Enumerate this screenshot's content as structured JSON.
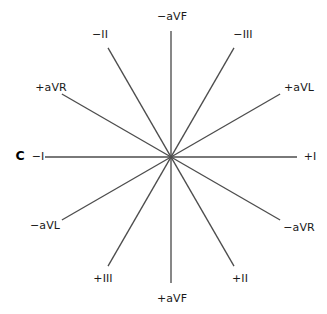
{
  "figure": {
    "panel_letter": "C",
    "panel_letter_position": {
      "x": 20,
      "y": 155
    },
    "canvas": {
      "width": 327,
      "height": 314
    },
    "center": {
      "x": 171,
      "y": 157
    },
    "line_color": "#4d4d4d",
    "label_color": "#1a1a1a",
    "background_color": "#ffffff",
    "axis_radius": 126
  },
  "axes": [
    {
      "name": "lead-I",
      "angle_deg": 0,
      "positive_label": "+I",
      "negative_label": "−I",
      "positive_label_position": {
        "x": 310,
        "y": 157
      },
      "negative_label_position": {
        "x": 38,
        "y": 157
      }
    },
    {
      "name": "lead-aVL",
      "angle_deg": 30,
      "positive_label": "+aVL",
      "negative_label": "−aVL",
      "positive_label_position": {
        "x": 299,
        "y": 88
      },
      "negative_label_position": {
        "x": 45,
        "y": 226
      }
    },
    {
      "name": "lead-III",
      "angle_deg": 60,
      "positive_label": "+III",
      "negative_label": "−III",
      "positive_label_position": {
        "x": 103,
        "y": 279
      },
      "negative_label_position": {
        "x": 243,
        "y": 35
      }
    },
    {
      "name": "lead-aVF",
      "angle_deg": 90,
      "positive_label": "+aVF",
      "negative_label": "−aVF",
      "positive_label_position": {
        "x": 172,
        "y": 299
      },
      "negative_label_position": {
        "x": 172,
        "y": 17
      }
    },
    {
      "name": "lead-II",
      "angle_deg": 120,
      "positive_label": "+II",
      "negative_label": "−II",
      "positive_label_position": {
        "x": 240,
        "y": 279
      },
      "negative_label_position": {
        "x": 100,
        "y": 35
      }
    },
    {
      "name": "lead-aVR",
      "angle_deg": 150,
      "positive_label": "+aVR",
      "negative_label": "−aVR",
      "positive_label_position": {
        "x": 51,
        "y": 88
      },
      "negative_label_position": {
        "x": 299,
        "y": 228
      }
    }
  ],
  "chart_data": {
    "type": "scatter",
    "title": "",
    "xlabel": "",
    "ylabel": "",
    "categories": [
      "−aVF",
      "−II",
      "−III",
      "+aVR",
      "+aVL",
      "−I",
      "+I",
      "−aVL",
      "−aVR",
      "+III",
      "+aVF",
      "+II"
    ],
    "values": [
      {
        "label": "+I",
        "angle_deg": 0
      },
      {
        "label": "+aVL",
        "angle_deg": 30
      },
      {
        "label": "−III",
        "angle_deg": 60
      },
      {
        "label": "−aVF",
        "angle_deg": 90
      },
      {
        "label": "−II",
        "angle_deg": 120
      },
      {
        "label": "+aVR",
        "angle_deg": 150
      },
      {
        "label": "−I",
        "angle_deg": 180
      },
      {
        "label": "−aVL",
        "angle_deg": 210
      },
      {
        "label": "+III",
        "angle_deg": 240
      },
      {
        "label": "+aVF",
        "angle_deg": 270
      },
      {
        "label": "+II",
        "angle_deg": 300
      },
      {
        "label": "−aVR",
        "angle_deg": 330
      }
    ],
    "legend": [],
    "grid": false,
    "axis_count": 6,
    "angle_step_deg": 30
  }
}
